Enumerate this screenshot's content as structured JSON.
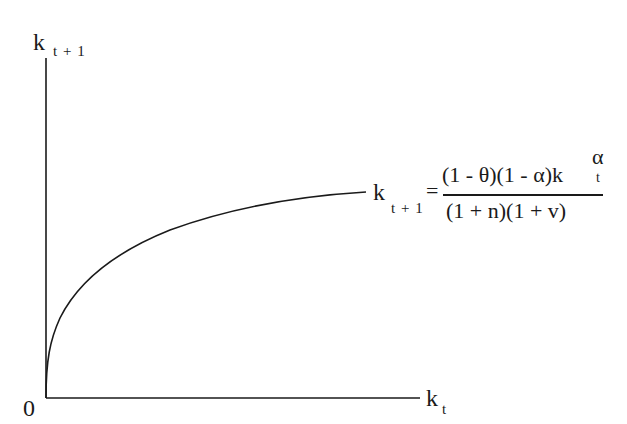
{
  "diagram": {
    "type": "economic-growth-phase-diagram",
    "y_axis": {
      "label_main": "k",
      "label_sub": "t + 1"
    },
    "x_axis": {
      "label_main": "k",
      "label_sub": "t"
    },
    "origin_label": "0",
    "curve": {
      "shape": "concave increasing from origin",
      "label": {
        "lhs_main": "k",
        "lhs_sub": "t + 1",
        "equals": "=",
        "numerator_main": "(1 - θ)(1 - α)k",
        "numerator_sup": "α",
        "numerator_sub": "t",
        "denominator": "(1 + n)(1 + v)"
      }
    },
    "colors": {
      "ink": "#1a1a1a",
      "background": "#ffffff"
    }
  }
}
